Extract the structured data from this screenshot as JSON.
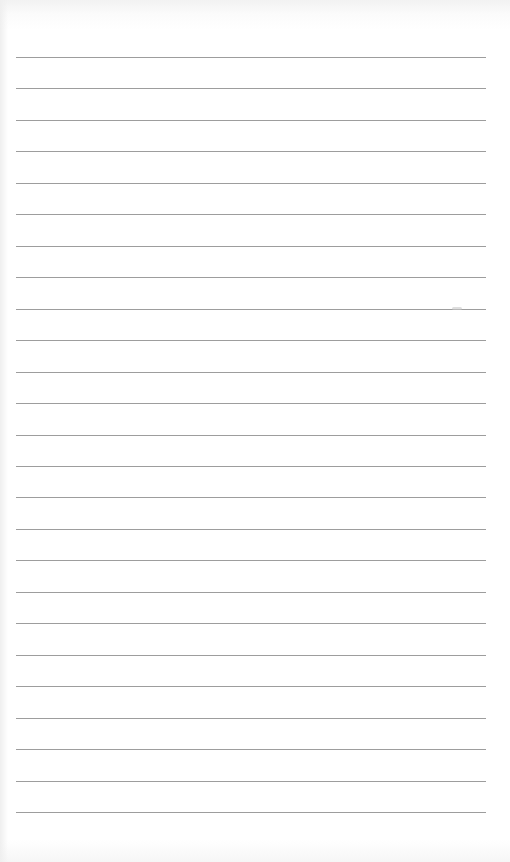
{
  "page": {
    "type": "lined-notebook-page",
    "background_color": "#ffffff",
    "rule_color": "#8c8c8c",
    "rule_left": 16,
    "rule_width": 470,
    "rule_count": 25,
    "rule_start_y": 57,
    "rule_spacing": 31.46,
    "text": ""
  },
  "marks": [
    {
      "x": 452,
      "y": 307
    }
  ]
}
